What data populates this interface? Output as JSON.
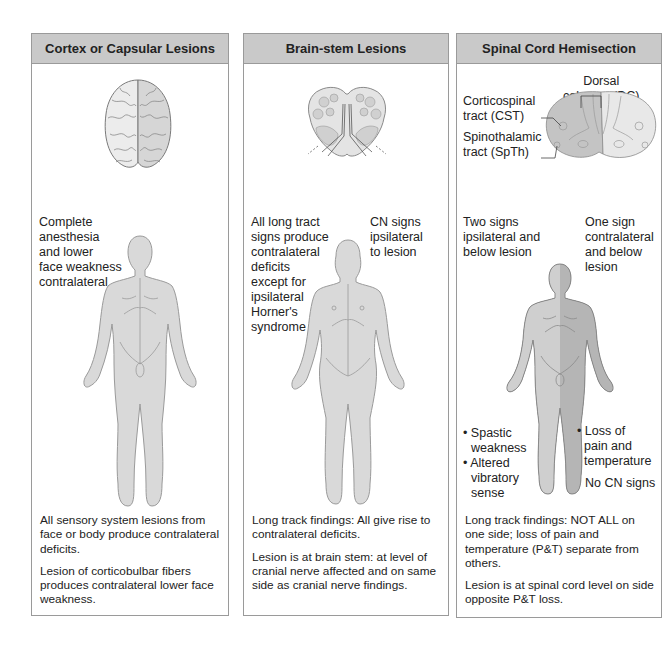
{
  "figure": {
    "panels": [
      {
        "id": "cortex",
        "title": "Cortex or Capsular Lesions",
        "illustration": "brain-top-view",
        "body_labels": [
          {
            "text": "Complete anesthesia and lower face weakness contralateral",
            "lines": [
              "Complete",
              "anesthesia",
              "and lower",
              "face weakness",
              "contralateral"
            ]
          }
        ],
        "notes": [
          "All sensory system lesions from face or body produce contralateral deficits.",
          "Lesion of corticobulbar fibers produces contralateral lower face weakness."
        ]
      },
      {
        "id": "brainstem",
        "title": "Brain-stem Lesions",
        "illustration": "brainstem-cross-section",
        "body_labels": [
          {
            "text": "All long tract signs produce contralateral deficits except for ipsilateral Horner's syndrome",
            "lines": [
              "All long tract",
              "signs produce",
              "contralateral",
              "deficits",
              "except for",
              "ipsilateral",
              "Horner's",
              "syndrome"
            ]
          },
          {
            "text": "CN signs ipsilateral to lesion",
            "lines": [
              "CN signs",
              "ipsilateral",
              "to lesion"
            ]
          }
        ],
        "notes": [
          "Long track findings: All give rise to contralateral deficits.",
          "Lesion is at brain stem: at level of cranial nerve affected and on same side as cranial nerve findings."
        ]
      },
      {
        "id": "spinal",
        "title": "Spinal Cord Hemisection",
        "illustration": "spinal-cord-cross-section",
        "cord_labels": {
          "dc": [
            "Dorsal",
            "columns (DC)"
          ],
          "cst": [
            "Corticospinal",
            "tract (CST)"
          ],
          "spth": [
            "Spinothalamic",
            "tract (SpTh)"
          ]
        },
        "body_labels": [
          {
            "text": "Two signs ipsilateral and below lesion",
            "lines": [
              "Two signs",
              "ipsilateral and",
              "below lesion"
            ]
          },
          {
            "text": "One sign contralateral and below lesion",
            "lines": [
              "One sign",
              "contralateral",
              "and below",
              "lesion"
            ]
          },
          {
            "text": "• Spastic weakness • Altered vibratory sense",
            "lines": [
              "• Spastic",
              "  weakness",
              "• Altered",
              "  vibratory",
              "  sense"
            ]
          },
          {
            "text": "• Loss of pain and temperature",
            "lines": [
              "• Loss of",
              "  pain and",
              "  temperature"
            ]
          },
          {
            "text": "No CN signs",
            "lines": [
              "No CN signs"
            ]
          }
        ],
        "notes": [
          "Long track findings: NOT ALL on one side; loss of pain and temperature (P&T) separate from others.",
          "Lesion is at spinal cord level on side opposite P&T loss."
        ]
      }
    ],
    "colors": {
      "header_bg": "#c9c9c9",
      "border": "#9a9a9a",
      "body_light": "#d9d9d9",
      "body_dark": "#bdbdbd",
      "outline": "#8a8a8a"
    }
  }
}
